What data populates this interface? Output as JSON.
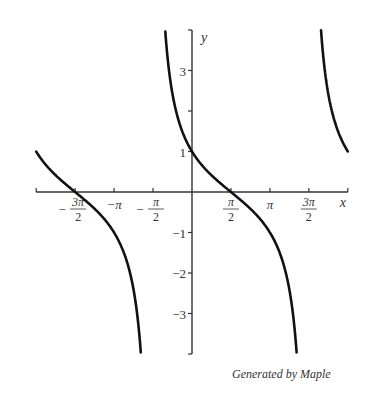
{
  "chart_data": {
    "type": "line",
    "title": "",
    "xlabel": "x",
    "ylabel": "y",
    "function": "cot(x/2 + π/4)",
    "xlim": [
      -6.2832,
      6.2832
    ],
    "ylim": [
      -4,
      4
    ],
    "grid": false,
    "x_ticks": [
      {
        "value": -4.7124,
        "label_num": "3π",
        "label_den": "2",
        "sign": "−"
      },
      {
        "value": -3.1416,
        "label": "−π"
      },
      {
        "value": -1.5708,
        "label_num": "π",
        "label_den": "2",
        "sign": "−"
      },
      {
        "value": 1.5708,
        "label_num": "π",
        "label_den": "2",
        "sign": ""
      },
      {
        "value": 3.1416,
        "label": "π"
      },
      {
        "value": 4.7124,
        "label_num": "3π",
        "label_den": "2",
        "sign": ""
      }
    ],
    "y_ticks": [
      {
        "value": 3,
        "label": "3"
      },
      {
        "value": 2,
        "label": ""
      },
      {
        "value": 1,
        "label": "1"
      },
      {
        "value": -1,
        "label": "−1"
      },
      {
        "value": -2,
        "label": "−2"
      },
      {
        "value": -3,
        "label": "−3"
      }
    ],
    "asymptotes": [
      -1.5708,
      4.7124
    ],
    "key_points": [
      {
        "x": -6.2832,
        "y": 1
      },
      {
        "x": -4.7124,
        "y": 0
      },
      {
        "x": 0,
        "y": 1
      },
      {
        "x": 1.5708,
        "y": 0
      },
      {
        "x": 6.2832,
        "y": 1
      }
    ]
  },
  "credit": "Generated by Maple"
}
